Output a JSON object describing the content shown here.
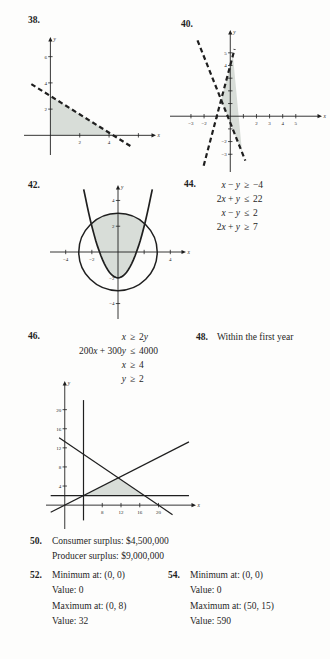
{
  "colors": {
    "ink": "#1f1f1f",
    "shade": "#d8ddd8",
    "bg": "#fdfdfc"
  },
  "labels": {
    "q38": "38.",
    "q40": "40.",
    "q42": "42.",
    "q44": "44.",
    "q46": "46.",
    "q48": "48.",
    "q50": "50.",
    "q52": "52.",
    "q54": "54."
  },
  "q44": {
    "inequalities": [
      {
        "lhs": "x − y",
        "rel": "≥",
        "rhs": "−4"
      },
      {
        "lhs": "2x + y",
        "rel": "≤",
        "rhs": "22"
      },
      {
        "lhs": "x − y",
        "rel": "≤",
        "rhs": "2"
      },
      {
        "lhs": "2x + y",
        "rel": "≥",
        "rhs": "7"
      }
    ]
  },
  "q46": {
    "inequalities": [
      {
        "lhs": "x",
        "rel": "≥",
        "rhs": "2y"
      },
      {
        "lhs": "200x + 300y",
        "rel": "≤",
        "rhs": "4000"
      },
      {
        "lhs": "x",
        "rel": "≥",
        "rhs": "4"
      },
      {
        "lhs": "y",
        "rel": "≥",
        "rhs": "2"
      }
    ]
  },
  "q48": {
    "text": "Within the first year"
  },
  "q50": {
    "lines": [
      "Consumer surplus: $4,500,000",
      "Producer surplus: $9,000,000"
    ]
  },
  "q52": {
    "lines": [
      "Minimum at: (0, 0)",
      "Value: 0",
      "Maximum at: (0, 8)",
      "Value: 32"
    ]
  },
  "q54": {
    "lines": [
      "Minimum at: (0, 0)",
      "Value: 0",
      "Maximum at: (50, 15)",
      "Value: 590"
    ]
  },
  "chart_data": [
    {
      "id": "g38",
      "exercise": "38",
      "type": "line",
      "subtype": "inequality-region",
      "xlabel": "x",
      "ylabel": "y",
      "xrange": [
        -1.8,
        7.2
      ],
      "yrange": [
        -1.5,
        7.5
      ],
      "xticks": [
        {
          "v": 2,
          "label": "2"
        },
        {
          "v": 4,
          "label": "4"
        },
        {
          "v": 6,
          "label": ""
        }
      ],
      "yticks": [
        {
          "v": 2,
          "label": "2"
        },
        {
          "v": 4,
          "label": "4"
        },
        {
          "v": 6,
          "label": "6"
        }
      ],
      "curves": [
        {
          "type": "segment",
          "dashed": true,
          "width": 2.2,
          "x1": -1.3,
          "y1": 3.91,
          "x2": 5.6,
          "y2": -0.92
        }
      ],
      "shaded_regions": [
        {
          "points": [
            [
              0,
              0
            ],
            [
              0,
              3
            ],
            [
              4.3,
              0
            ]
          ]
        }
      ]
    },
    {
      "id": "g40",
      "exercise": "40",
      "type": "line",
      "subtype": "inequality-region",
      "xlabel": "x",
      "ylabel": "y",
      "xrange": [
        -4.6,
        7.0
      ],
      "yrange": [
        -4.4,
        6.8
      ],
      "xticks": [
        {
          "v": -3,
          "label": "−3"
        },
        {
          "v": -2,
          "label": "−2"
        },
        {
          "v": -1,
          "label": ""
        },
        {
          "v": 1,
          "label": ""
        },
        {
          "v": 2,
          "label": "2"
        },
        {
          "v": 3,
          "label": "3"
        },
        {
          "v": 4,
          "label": "4"
        },
        {
          "v": 5,
          "label": "5"
        }
      ],
      "yticks": [
        {
          "v": 5,
          "label": "5"
        },
        {
          "v": 4,
          "label": "4"
        },
        {
          "v": 3,
          "label": ""
        },
        {
          "v": 2,
          "label": ""
        },
        {
          "v": 1,
          "label": ""
        },
        {
          "v": -1,
          "label": ""
        },
        {
          "v": -2,
          "label": "−2"
        },
        {
          "v": -3,
          "label": "−3"
        }
      ],
      "curves": [
        {
          "type": "segment",
          "dashed": true,
          "width": 2.2,
          "x1": -2.03,
          "y1": -3.9,
          "x2": 0.33,
          "y2": 5.3
        },
        {
          "type": "segment",
          "dashed": true,
          "width": 2.2,
          "x1": -2.5,
          "y1": 5.98,
          "x2": 1.15,
          "y2": -3.51
        }
      ],
      "shaded_regions": [
        {
          "points": [
            [
              -0.7,
              1.29
            ],
            [
              0.2,
              4.78
            ],
            [
              0.9,
              -2.86
            ]
          ]
        }
      ]
    },
    {
      "id": "g42",
      "exercise": "42",
      "type": "line",
      "subtype": "inequality-region",
      "xlabel": "x",
      "ylabel": "y",
      "xrange": [
        -5.2,
        5.2
      ],
      "yrange": [
        -5.2,
        5.2
      ],
      "xticks": [
        {
          "v": -4,
          "label": "−4"
        },
        {
          "v": -2,
          "label": "−2"
        },
        {
          "v": 2,
          "label": ""
        },
        {
          "v": 4,
          "label": "4"
        }
      ],
      "yticks": [
        {
          "v": 4,
          "label": "4"
        },
        {
          "v": 2,
          "label": "2"
        },
        {
          "v": -2,
          "label": "−2"
        },
        {
          "v": -4,
          "label": "−4"
        }
      ],
      "curves": [
        {
          "type": "circle",
          "cx": 0,
          "cy": 0,
          "r": 3,
          "width": 1.5
        },
        {
          "type": "parabola",
          "a": 1,
          "h": 0,
          "k": -2,
          "x1": -2.62,
          "x2": 2.62,
          "width": 1.7
        }
      ],
      "shaded_regions": [
        {
          "points": [
            [
              -2.05,
              2.2
            ],
            [
              -1.8,
              1.24
            ],
            [
              -1.5,
              0.25
            ],
            [
              -1.2,
              -0.56
            ],
            [
              -0.9,
              -1.19
            ],
            [
              -0.6,
              -1.64
            ],
            [
              -0.3,
              -1.91
            ],
            [
              0,
              -2
            ],
            [
              0.3,
              -1.91
            ],
            [
              0.6,
              -1.64
            ],
            [
              0.9,
              -1.19
            ],
            [
              1.2,
              -0.56
            ],
            [
              1.5,
              0.25
            ],
            [
              1.8,
              1.24
            ],
            [
              2.05,
              2.2
            ],
            [
              1.7,
              2.47
            ],
            [
              1.3,
              2.7
            ],
            [
              0.9,
              2.86
            ],
            [
              0.45,
              2.97
            ],
            [
              0,
              3
            ],
            [
              -0.45,
              2.97
            ],
            [
              -0.9,
              2.86
            ],
            [
              -1.3,
              2.7
            ],
            [
              -1.7,
              2.47
            ]
          ]
        }
      ]
    },
    {
      "id": "g46",
      "exercise": "46",
      "type": "line",
      "subtype": "inequality-region",
      "xlabel": "x",
      "ylabel": "y",
      "xrange": [
        -4,
        28
      ],
      "yrange": [
        -5,
        26
      ],
      "xticks": [
        {
          "v": 4,
          "label": ""
        },
        {
          "v": 8,
          "label": "8"
        },
        {
          "v": 12,
          "label": "12"
        },
        {
          "v": 16,
          "label": "16"
        },
        {
          "v": 20,
          "label": "20"
        }
      ],
      "yticks": [
        {
          "v": 4,
          "label": "4"
        },
        {
          "v": 8,
          "label": "8"
        },
        {
          "v": 12,
          "label": "12"
        },
        {
          "v": 16,
          "label": "16"
        },
        {
          "v": 20,
          "label": "20"
        }
      ],
      "curves": [
        {
          "type": "segment",
          "width": 1.2,
          "x1": 4,
          "y1": -3.2,
          "x2": 4,
          "y2": 22
        },
        {
          "type": "segment",
          "width": 1.2,
          "x1": -3,
          "y1": 2,
          "x2": 26.5,
          "y2": 2
        },
        {
          "type": "segment",
          "width": 1.2,
          "x1": -1.2,
          "y1": 14.13,
          "x2": 23,
          "y2": -2.0
        },
        {
          "type": "segment",
          "width": 1.2,
          "x1": -3,
          "y1": -1.5,
          "x2": 26.5,
          "y2": 13.25
        }
      ],
      "shaded_regions": [
        {
          "points": [
            [
              4,
              2
            ],
            [
              17,
              2
            ],
            [
              11.43,
              5.71
            ]
          ]
        }
      ]
    }
  ]
}
